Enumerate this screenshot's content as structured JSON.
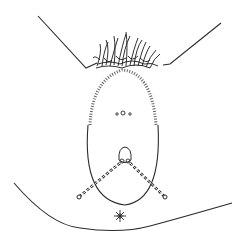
{
  "figure": {
    "type": "line-illustration",
    "stroke_color": "#2a2a2a",
    "background_color": "#ffffff",
    "markers": {
      "small_circles_count": 3,
      "dashed_lines_count": 2,
      "star_marker_count": 1
    }
  }
}
